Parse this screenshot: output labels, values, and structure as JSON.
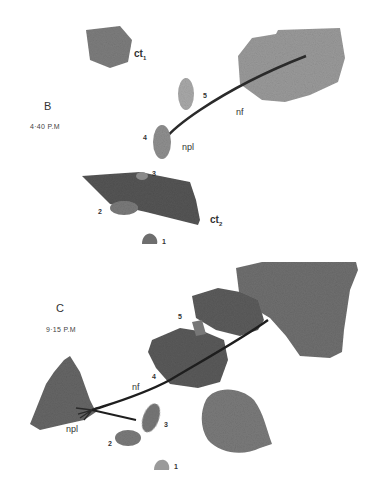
{
  "figure": {
    "panels": [
      {
        "id": "B",
        "label": "B",
        "time": "4·40 P.M",
        "annotations": {
          "ct1": "ct",
          "ct1_sub": "1",
          "ct2": "ct",
          "ct2_sub": "2",
          "nf": "nf",
          "npl": "npl",
          "cells": [
            "1",
            "2",
            "3",
            "4",
            "5"
          ]
        }
      },
      {
        "id": "C",
        "label": "C",
        "time": "9·15 P.M",
        "annotations": {
          "nf": "nf",
          "npl": "npl",
          "cells": [
            "1",
            "2",
            "3",
            "4",
            "5"
          ]
        }
      }
    ]
  }
}
